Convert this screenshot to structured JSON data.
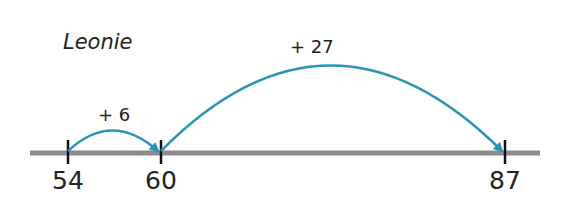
{
  "title": "Leonie",
  "number_line": {
    "color": "#8c8c8c",
    "ticks": [
      {
        "value": "54",
        "x": 68
      },
      {
        "value": "60",
        "x": 161
      },
      {
        "value": "87",
        "x": 505
      }
    ]
  },
  "jumps": [
    {
      "label": "+ 6",
      "from": "54",
      "to": "60",
      "color": "#2a93b8"
    },
    {
      "label": "+ 27",
      "from": "60",
      "to": "87",
      "color": "#2a93b8"
    }
  ]
}
